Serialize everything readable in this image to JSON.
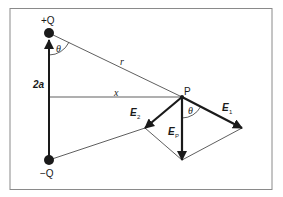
{
  "figure": {
    "labels": {
      "plus_charge": "+Q",
      "minus_charge": "−Q",
      "separation": "2a",
      "distance_r": "r",
      "distance_x": "x",
      "point": "P",
      "angle_top": "θ",
      "angle_p": "θ",
      "field_1_main": "E",
      "field_1_sub": "1",
      "field_2_main": "E",
      "field_2_sub": "2",
      "field_p_main": "E",
      "field_p_sub": "P"
    },
    "colors": {
      "line": "#1a1a1a",
      "frame": "#8a8a8a",
      "background": "#ffffff"
    }
  }
}
